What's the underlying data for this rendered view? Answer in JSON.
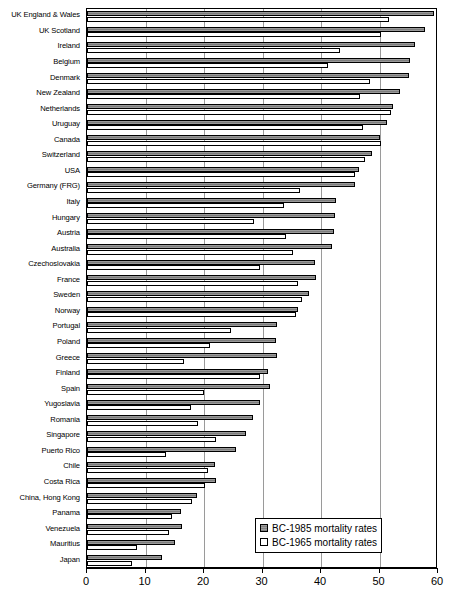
{
  "chart_data": {
    "type": "bar",
    "orientation": "horizontal",
    "title": "",
    "subtitle": "",
    "xlabel": "",
    "ylabel": "",
    "xlim": [
      0,
      60
    ],
    "ylim": null,
    "xticks": [
      0,
      10,
      20,
      30,
      40,
      50,
      60
    ],
    "xtick_labels": [
      "0",
      "10",
      "20",
      "30",
      "40",
      "50",
      "60"
    ],
    "grid": "vertical",
    "legend_position": "bottom-right",
    "categories": [
      "UK England & Wales",
      "UK Scotland",
      "Ireland",
      "Belgium",
      "Denmark",
      "New Zealand",
      "Netherlands",
      "Uruguay",
      "Canada",
      "Switzerland",
      "USA",
      "Germany (FRG)",
      "Italy",
      "Hungary",
      "Austria",
      "Australia",
      "Czechoslovakia",
      "France",
      "Sweden",
      "Norway",
      "Portugal",
      "Poland",
      "Greece",
      "Finland",
      "Spain",
      "Yugoslavia",
      "Romania",
      "Singapore",
      "Puerto Rico",
      "Chile",
      "Costa Rica",
      "China, Hong Kong",
      "Panama",
      "Venezuela",
      "Mauritius",
      "Japan"
    ],
    "series": [
      {
        "name": "BC-1985 mortality  rates",
        "key": "s1985",
        "color": "#8d8d8d",
        "values": [
          59.3,
          57.8,
          56.0,
          55.2,
          55.0,
          53.5,
          52.3,
          51.2,
          50.0,
          48.8,
          46.5,
          45.8,
          42.5,
          42.4,
          42.3,
          41.8,
          39.0,
          39.2,
          38.0,
          36.0,
          32.5,
          32.3,
          32.4,
          31.0,
          31.2,
          29.5,
          28.4,
          27.2,
          25.5,
          21.8,
          22.0,
          18.8,
          16.0,
          16.2,
          15.0,
          12.8
        ]
      },
      {
        "name": "BC-1965 mortality  rates",
        "key": "s1965",
        "color": "#ffffff",
        "values": [
          51.6,
          50.3,
          43.3,
          41.2,
          48.3,
          46.7,
          52.0,
          47.2,
          50.3,
          47.5,
          45.8,
          36.4,
          33.6,
          28.5,
          34.0,
          35.2,
          29.5,
          36.0,
          36.8,
          35.7,
          24.6,
          21.0,
          16.5,
          29.5,
          20.0,
          17.8,
          19.0,
          22.0,
          13.5,
          20.6,
          20.2,
          18.0,
          14.5,
          14.0,
          8.5,
          7.7
        ]
      }
    ]
  },
  "legend": {
    "items": [
      {
        "label": "BC-1985 mortality  rates",
        "key": "s1985"
      },
      {
        "label": "BC-1965 mortality  rates",
        "key": "s1965"
      }
    ]
  }
}
